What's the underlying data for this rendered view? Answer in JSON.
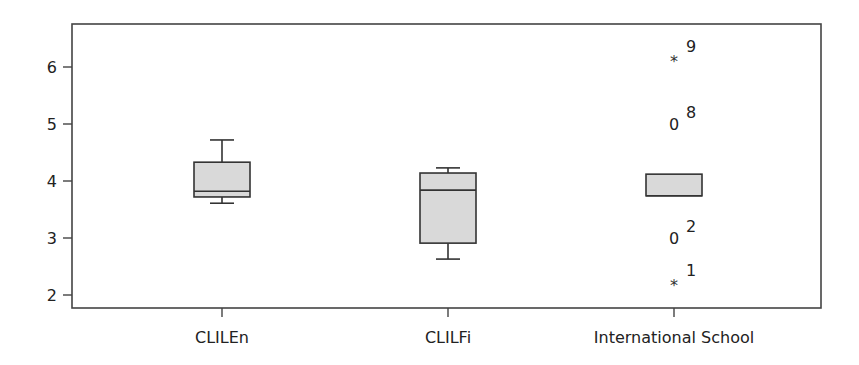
{
  "chart_data": {
    "type": "boxplot",
    "title": "",
    "xlabel": "",
    "ylabel": "",
    "ylim": [
      1.75,
      6.75
    ],
    "yticks": [
      2,
      3,
      4,
      5,
      6
    ],
    "grid": false,
    "legend": null,
    "categories": [
      "CLILEn",
      "CLILFi",
      "International School"
    ],
    "series": [
      {
        "name": "CLILEn",
        "whisker_low": 3.61,
        "q1": 3.72,
        "median": 3.82,
        "q3": 4.33,
        "whisker_high": 4.72,
        "outliers": []
      },
      {
        "name": "CLILFi",
        "whisker_low": 2.63,
        "q1": 2.91,
        "median": 3.84,
        "q3": 4.14,
        "whisker_high": 4.23,
        "outliers": []
      },
      {
        "name": "International School",
        "whisker_low": 3.74,
        "q1": 3.74,
        "median": 3.74,
        "q3": 4.12,
        "whisker_high": 4.12,
        "outliers": [
          {
            "label": "9",
            "value": 6.15,
            "marker": "*"
          },
          {
            "label": "8",
            "value": 5.0,
            "marker": "o"
          },
          {
            "label": "2",
            "value": 3.0,
            "marker": "o"
          },
          {
            "label": "1",
            "value": 2.23,
            "marker": "*"
          }
        ]
      }
    ]
  },
  "style": {
    "box_fill": "#d9d9d9",
    "line_color": "#333333",
    "frame_color": "#444444",
    "background": "#ffffff"
  }
}
